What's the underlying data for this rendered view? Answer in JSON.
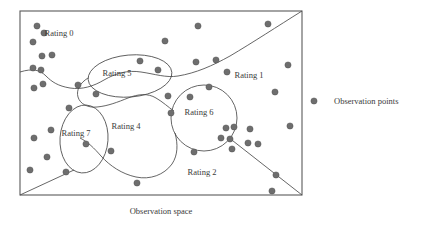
{
  "figure": {
    "caption": "Observation space",
    "dot_color": "#6e6e6e",
    "dot_stroke_color": "#525252",
    "line_color": "#4a4a4a",
    "frame_color": "#5a5a5a",
    "dot_radius": 3.1
  },
  "frame": {
    "x": 20,
    "y": 11,
    "width": 282,
    "height": 184
  },
  "regions": [
    {
      "id": "rating-0",
      "label": "Rating 0",
      "lx": 59,
      "ly": 36
    },
    {
      "id": "rating-5",
      "label": "Rating 5",
      "lx": 117,
      "ly": 76
    },
    {
      "id": "rating-1",
      "label": "Rating 1",
      "lx": 249,
      "ly": 78
    },
    {
      "id": "rating-6",
      "label": "Rating 6",
      "lx": 199,
      "ly": 115
    },
    {
      "id": "rating-4",
      "label": "Rating 4",
      "lx": 126,
      "ly": 129
    },
    {
      "id": "rating-7",
      "label": "Rating 7",
      "lx": 76,
      "ly": 136
    },
    {
      "id": "rating-2",
      "label": "Rating 2",
      "lx": 202,
      "ly": 175
    }
  ],
  "cluster_shapes": [
    {
      "id": "rating-5-ellipse",
      "cx": 130,
      "cy": 76,
      "rx": 42,
      "ry": 21,
      "rotate": -5
    },
    {
      "id": "rating-6-circle",
      "cx": 204,
      "cy": 118,
      "rx": 33,
      "ry": 33,
      "rotate": 0
    },
    {
      "id": "rating-7-ellipse",
      "cx": 84,
      "cy": 139,
      "rx": 24,
      "ry": 34,
      "rotate": 4
    }
  ],
  "boundaries": [
    {
      "id": "rating-0-boundary",
      "d": "M 20 72 C 33 68 40 70 46 76 C 52 82 58 86 70 88 C 82 90 94 86 104 80 C 116 73 128 70 141 72 C 155 74 166 78 178 76 C 196 73 212 66 230 56 C 252 43 278 26 302 11"
    },
    {
      "id": "rating-5-to-4-boundary",
      "d": "M 88 78 C 80 83 76 90 78 97 C 80 104 88 108 97 107 C 108 106 118 102 128 98 C 138 94 148 93 156 98 C 163 102 168 107 174 111"
    },
    {
      "id": "rating-4-to-2-boundary",
      "d": "M 175 133 C 178 144 178 155 172 164 C 164 175 150 180 136 177 C 122 174 110 166 101 156 C 94 148 88 142 80 138"
    },
    {
      "id": "rating-7-to-corner-line",
      "d": "M 74 170 L 20 195"
    },
    {
      "id": "rating-6-to-corner-line",
      "d": "M 228 137 L 302 195"
    }
  ],
  "observation_points": [
    {
      "x": 37,
      "y": 26
    },
    {
      "x": 44,
      "y": 33
    },
    {
      "x": 33,
      "y": 42
    },
    {
      "x": 42,
      "y": 56
    },
    {
      "x": 52,
      "y": 55
    },
    {
      "x": 33,
      "y": 68
    },
    {
      "x": 41,
      "y": 70
    },
    {
      "x": 43,
      "y": 84
    },
    {
      "x": 34,
      "y": 88
    },
    {
      "x": 78,
      "y": 85
    },
    {
      "x": 96,
      "y": 94
    },
    {
      "x": 69,
      "y": 108
    },
    {
      "x": 51,
      "y": 130
    },
    {
      "x": 34,
      "y": 138
    },
    {
      "x": 47,
      "y": 157
    },
    {
      "x": 30,
      "y": 170
    },
    {
      "x": 66,
      "y": 172
    },
    {
      "x": 86,
      "y": 144
    },
    {
      "x": 111,
      "y": 151
    },
    {
      "x": 137,
      "y": 183
    },
    {
      "x": 140,
      "y": 61
    },
    {
      "x": 158,
      "y": 70
    },
    {
      "x": 165,
      "y": 41
    },
    {
      "x": 198,
      "y": 26
    },
    {
      "x": 168,
      "y": 96
    },
    {
      "x": 171,
      "y": 113
    },
    {
      "x": 190,
      "y": 97
    },
    {
      "x": 209,
      "y": 87
    },
    {
      "x": 196,
      "y": 62
    },
    {
      "x": 216,
      "y": 60
    },
    {
      "x": 227,
      "y": 72
    },
    {
      "x": 268,
      "y": 24
    },
    {
      "x": 288,
      "y": 65
    },
    {
      "x": 275,
      "y": 92
    },
    {
      "x": 290,
      "y": 126
    },
    {
      "x": 250,
      "y": 129
    },
    {
      "x": 248,
      "y": 143
    },
    {
      "x": 258,
      "y": 144
    },
    {
      "x": 226,
      "y": 128
    },
    {
      "x": 234,
      "y": 127
    },
    {
      "x": 221,
      "y": 138
    },
    {
      "x": 230,
      "y": 139
    },
    {
      "x": 232,
      "y": 149
    },
    {
      "x": 194,
      "y": 152
    },
    {
      "x": 276,
      "y": 175
    },
    {
      "x": 272,
      "y": 191
    }
  ],
  "legend": {
    "label": "Observation points",
    "dot_x": 314,
    "dot_y": 101,
    "text_x": 334,
    "text_y": 104
  }
}
